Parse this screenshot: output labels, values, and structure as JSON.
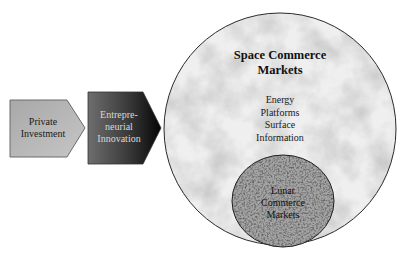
{
  "diagram": {
    "arrows": [
      {
        "label": "Private Investment",
        "lines": [
          "Private",
          "Investment"
        ],
        "fill": "#b0b0b0"
      },
      {
        "label": "Entrepreneurial Innovation",
        "lines": [
          "Entrepre-",
          "neurial",
          "Innovation"
        ],
        "fill_start": "#707070",
        "fill_end": "#050505"
      }
    ],
    "outer_circle": {
      "title_lines": [
        "Space Commerce",
        "Markets"
      ],
      "items": [
        "Energy",
        "Platforms",
        "Surface",
        "Information"
      ],
      "fill": "#ececec"
    },
    "inner_circle": {
      "title_lines": [
        "Lunar",
        "Commerce",
        "Markets"
      ],
      "fill": "#9a9a9a"
    }
  }
}
